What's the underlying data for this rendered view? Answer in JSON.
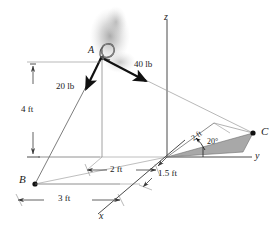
{
  "axes": {
    "z_label": "z",
    "y_label": "y",
    "x_label": "x"
  },
  "points": {
    "a_label": "A",
    "b_label": "B",
    "c_label": "C"
  },
  "forces": [
    {
      "id": "force-20lb",
      "label": "20 lb",
      "magnitude": 20,
      "unit": "lb"
    },
    {
      "id": "force-40lb",
      "label": "40 lb",
      "magnitude": 40,
      "unit": "lb"
    }
  ],
  "dimensions": [
    {
      "id": "dim-4ft",
      "label": "4 ft",
      "value": 4,
      "unit": "ft"
    },
    {
      "id": "dim-2ft-y",
      "label": "2 ft",
      "value": 2,
      "unit": "ft"
    },
    {
      "id": "dim-3ft",
      "label": "3 ft",
      "value": 3,
      "unit": "ft"
    },
    {
      "id": "dim-15ft",
      "label": "1.5 ft",
      "value": 1.5,
      "unit": "ft"
    },
    {
      "id": "dim-2ft-c",
      "label": "2 ft",
      "value": 2,
      "unit": "ft"
    }
  ],
  "angles": [
    {
      "id": "angle-20deg",
      "label": "20°",
      "value": 20,
      "unit": "deg"
    }
  ],
  "colors": {
    "line": "#3a3a3a",
    "thin_line": "#8a8a8a",
    "fill_triangle": "#a6a6a6",
    "arrow": "#111111",
    "text": "#1a1a1a",
    "shadow": "#b9b9b9"
  }
}
